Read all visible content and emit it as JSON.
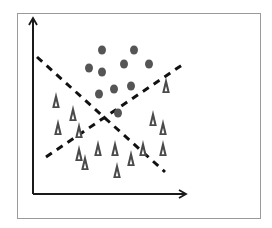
{
  "diagram": {
    "title": "",
    "colors": {
      "frame": "#9a9a9a",
      "axis": "#1a1a1a",
      "line": "#111111",
      "circle": "#555555",
      "triangle": "#4a4a4a",
      "triangle_inner": "#ffffff"
    },
    "axes": {
      "x": {
        "x1": 33,
        "y1": 194,
        "x2": 186,
        "y2": 194,
        "label": ""
      },
      "y": {
        "x1": 33,
        "y1": 194,
        "x2": 33,
        "y2": 18,
        "label": ""
      }
    },
    "lines": [
      {
        "name": "descending-separator",
        "x1": 37,
        "y1": 57,
        "x2": 165,
        "y2": 172,
        "style": "dashed"
      },
      {
        "name": "ascending-separator",
        "x1": 46,
        "y1": 157,
        "x2": 185,
        "y2": 63,
        "style": "dashed"
      }
    ],
    "circles": [
      {
        "x": 102,
        "y": 50
      },
      {
        "x": 134,
        "y": 50
      },
      {
        "x": 89,
        "y": 68
      },
      {
        "x": 102,
        "y": 72
      },
      {
        "x": 124,
        "y": 64
      },
      {
        "x": 149,
        "y": 64
      },
      {
        "x": 99,
        "y": 94
      },
      {
        "x": 114,
        "y": 89
      },
      {
        "x": 131,
        "y": 86
      },
      {
        "x": 118,
        "y": 113
      }
    ],
    "triangles": [
      {
        "x": 56,
        "y": 100
      },
      {
        "x": 73,
        "y": 113
      },
      {
        "x": 58,
        "y": 127
      },
      {
        "x": 79,
        "y": 130
      },
      {
        "x": 79,
        "y": 153
      },
      {
        "x": 85,
        "y": 162
      },
      {
        "x": 98,
        "y": 148
      },
      {
        "x": 115,
        "y": 148
      },
      {
        "x": 117,
        "y": 170
      },
      {
        "x": 131,
        "y": 158
      },
      {
        "x": 143,
        "y": 148
      },
      {
        "x": 153,
        "y": 118
      },
      {
        "x": 163,
        "y": 127
      },
      {
        "x": 163,
        "y": 148
      },
      {
        "x": 166,
        "y": 85
      }
    ]
  }
}
